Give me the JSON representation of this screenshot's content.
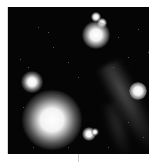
{
  "image": {
    "subject": "astronomical-field-stars-and-nebula",
    "colors": {
      "background": "#ffffff",
      "sky": "#050505"
    }
  },
  "stars": [
    {
      "x": 88,
      "y": 10,
      "r": 5,
      "core": 1.5
    },
    {
      "x": 94,
      "y": 16,
      "r": 5,
      "core": 1.5
    },
    {
      "x": 88,
      "y": 28,
      "r": 14,
      "core": 4
    },
    {
      "x": 24,
      "y": 75,
      "r": 11,
      "core": 3
    },
    {
      "x": 44,
      "y": 113,
      "r": 30,
      "core": 8
    },
    {
      "x": 130,
      "y": 84,
      "r": 9,
      "core": 3
    },
    {
      "x": 81,
      "y": 127,
      "r": 7,
      "core": 2
    },
    {
      "x": 87,
      "y": 125,
      "r": 4,
      "core": 1
    }
  ]
}
